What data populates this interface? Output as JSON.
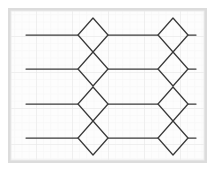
{
  "figure": {
    "type": "line-diagram",
    "width": 215,
    "height": 171,
    "background_color": "#ffffff",
    "frame": {
      "x": 8,
      "y": 8,
      "width": 199,
      "height": 155,
      "fill_color": "#fdfdfd",
      "border_color": "#d8d8d8",
      "border_width": 3,
      "inner_border_color": "#efefef"
    },
    "grid": {
      "visible": true,
      "minor_spacing": 7.2,
      "major_spacing": 36,
      "minor_color": "#f2f2f2",
      "major_color": "#e6e6e6",
      "origin_x": 10,
      "origin_y": 10
    },
    "stroke": {
      "color": "#3a3a3a",
      "width": 1.25
    }
  },
  "chart_data": {
    "type": "line",
    "title": "",
    "xlabel": "",
    "ylabel": "",
    "tracks": [
      {
        "id": "track-1",
        "y": 35,
        "x_start": 26,
        "x_end": 196
      },
      {
        "id": "track-2",
        "y": 69,
        "x_start": 26,
        "x_end": 196
      },
      {
        "id": "track-3",
        "y": 104,
        "x_start": 26,
        "x_end": 196
      },
      {
        "id": "track-4",
        "y": 138,
        "x_start": 26,
        "x_end": 196
      }
    ],
    "columns": [
      {
        "id": "column-left",
        "center_x": 93,
        "half_width": 15
      },
      {
        "id": "column-right",
        "center_x": 173,
        "half_width": 15
      }
    ],
    "diamonds": [
      {
        "id": "diamond-L1",
        "cx": 93,
        "cy": 35,
        "rx": 15,
        "ry": 17
      },
      {
        "id": "diamond-L2",
        "cx": 93,
        "cy": 69,
        "rx": 15,
        "ry": 17
      },
      {
        "id": "diamond-L3",
        "cx": 93,
        "cy": 104,
        "rx": 15,
        "ry": 17
      },
      {
        "id": "diamond-L4",
        "cx": 93,
        "cy": 138,
        "rx": 15,
        "ry": 17
      },
      {
        "id": "diamond-R1",
        "cx": 173,
        "cy": 35,
        "rx": 15,
        "ry": 17
      },
      {
        "id": "diamond-R2",
        "cx": 173,
        "cy": 69,
        "rx": 15,
        "ry": 17
      },
      {
        "id": "diamond-R3",
        "cx": 173,
        "cy": 104,
        "rx": 15,
        "ry": 17
      },
      {
        "id": "diamond-R4",
        "cx": 173,
        "cy": 138,
        "rx": 15,
        "ry": 17
      }
    ],
    "segments": [
      {
        "id": "seg-l1",
        "x1": 26,
        "y1": 35,
        "x2": 78,
        "y2": 35
      },
      {
        "id": "seg-l2",
        "x1": 26,
        "y1": 69,
        "x2": 78,
        "y2": 69
      },
      {
        "id": "seg-l3",
        "x1": 26,
        "y1": 104,
        "x2": 78,
        "y2": 104
      },
      {
        "id": "seg-l4",
        "x1": 26,
        "y1": 138,
        "x2": 78,
        "y2": 138
      },
      {
        "id": "seg-m1",
        "x1": 108,
        "y1": 35,
        "x2": 158,
        "y2": 35
      },
      {
        "id": "seg-m2",
        "x1": 108,
        "y1": 69,
        "x2": 158,
        "y2": 69
      },
      {
        "id": "seg-m3",
        "x1": 108,
        "y1": 104,
        "x2": 158,
        "y2": 104
      },
      {
        "id": "seg-m4",
        "x1": 108,
        "y1": 138,
        "x2": 158,
        "y2": 138
      },
      {
        "id": "seg-r1",
        "x1": 188,
        "y1": 35,
        "x2": 196,
        "y2": 35
      },
      {
        "id": "seg-r2",
        "x1": 188,
        "y1": 69,
        "x2": 196,
        "y2": 69
      },
      {
        "id": "seg-r3",
        "x1": 188,
        "y1": 104,
        "x2": 196,
        "y2": 104
      },
      {
        "id": "seg-r4",
        "x1": 188,
        "y1": 138,
        "x2": 196,
        "y2": 138
      }
    ],
    "diamond_count": 8,
    "track_count": 4,
    "column_count": 2
  }
}
